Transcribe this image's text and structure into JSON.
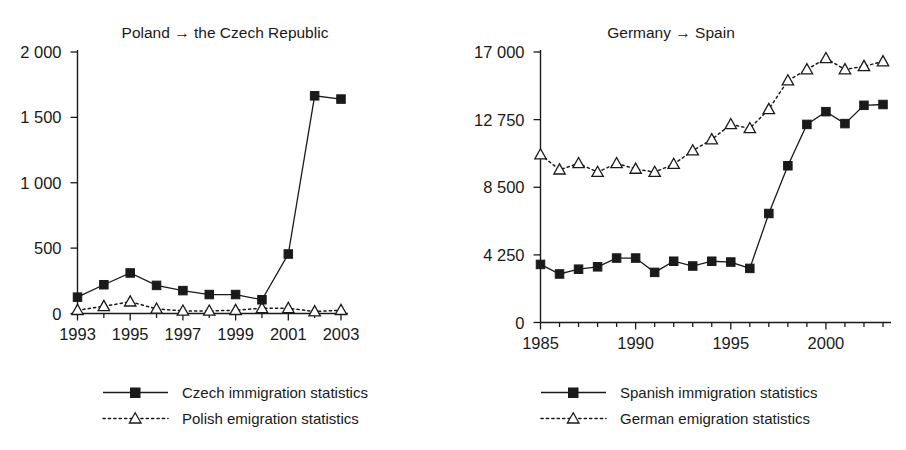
{
  "figure": {
    "background": "#ffffff",
    "ink_color": "#1a1a1a"
  },
  "chart_data": [
    {
      "type": "line",
      "panel": "left",
      "title": "Poland → the Czech Republic",
      "xlabel": "",
      "ylabel": "",
      "x": [
        1993,
        1994,
        1995,
        1996,
        1997,
        1998,
        1999,
        2000,
        2001,
        2002,
        2003
      ],
      "xlim": [
        1993,
        2003
      ],
      "xticks_labeled": [
        "1993",
        "1995",
        "1997",
        "1999",
        "2001",
        "2003"
      ],
      "xticks_labeled_values": [
        1993,
        1995,
        1997,
        1999,
        2001,
        2003
      ],
      "xtick_step_minor": 1,
      "ylim": [
        0,
        2000
      ],
      "yticks": [
        0,
        500,
        1000,
        1500,
        2000
      ],
      "ytick_labels": [
        "0",
        "500",
        "1 000",
        "1 500",
        "2 000"
      ],
      "grid": false,
      "legend_position": "below",
      "series": [
        {
          "name": "Czech immigration statistics",
          "marker": "filled-square",
          "line": "solid",
          "values": [
            125,
            220,
            310,
            215,
            175,
            145,
            145,
            105,
            455,
            1665,
            1640
          ]
        },
        {
          "name": "Polish emigration statistics",
          "marker": "open-triangle",
          "line": "dotted",
          "values": [
            25,
            55,
            90,
            35,
            20,
            20,
            25,
            40,
            40,
            15,
            25
          ]
        }
      ]
    },
    {
      "type": "line",
      "panel": "right",
      "title": "Germany → Spain",
      "xlabel": "",
      "ylabel": "",
      "x": [
        1985,
        1986,
        1987,
        1988,
        1989,
        1990,
        1991,
        1992,
        1993,
        1994,
        1995,
        1996,
        1997,
        1998,
        1999,
        2000,
        2001,
        2002,
        2003
      ],
      "xlim": [
        1985,
        2003
      ],
      "xticks_labeled": [
        "1985",
        "1990",
        "1995",
        "2000"
      ],
      "xticks_labeled_values": [
        1985,
        1990,
        1995,
        2000
      ],
      "xtick_step_minor": 1,
      "ylim": [
        0,
        17000
      ],
      "yticks": [
        0,
        4250,
        8500,
        12750,
        17000
      ],
      "ytick_labels": [
        "0",
        "4 250",
        "8 500",
        "12 750",
        "17 000"
      ],
      "grid": false,
      "legend_position": "below",
      "series": [
        {
          "name": "Spanish immigration statistics",
          "marker": "filled-square",
          "line": "solid",
          "values": [
            3650,
            3050,
            3350,
            3500,
            4050,
            4050,
            3150,
            3850,
            3550,
            3850,
            3800,
            3400,
            6850,
            9850,
            12450,
            13250,
            12500,
            13650,
            13700
          ]
        },
        {
          "name": "German emigration statistics",
          "marker": "open-triangle",
          "line": "dotted",
          "values": [
            10550,
            9600,
            10000,
            9450,
            10000,
            9650,
            9450,
            9950,
            10800,
            11500,
            12450,
            12200,
            13400,
            15200,
            15900,
            16600,
            15900,
            16100,
            16400
          ]
        }
      ]
    }
  ]
}
